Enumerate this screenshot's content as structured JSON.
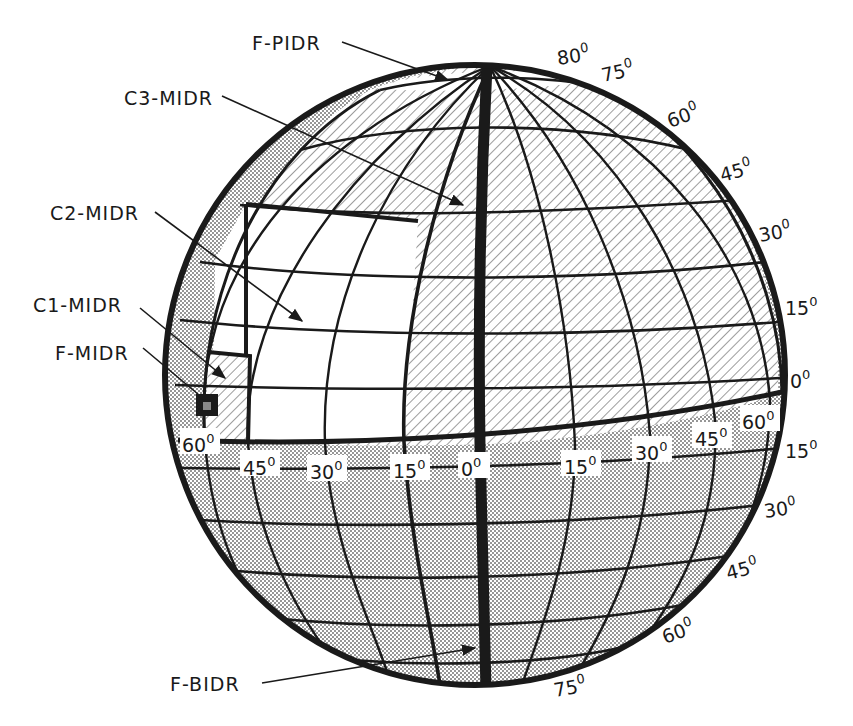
{
  "figure": {
    "type": "globe-coverage-diagram",
    "colors": {
      "background": "#ffffff",
      "ink": "#1a1a1a",
      "stipple": "#9a9a9a",
      "hatch": "#555555"
    }
  },
  "callouts": [
    {
      "id": "f-pidr",
      "label": "F-PIDR"
    },
    {
      "id": "c3-midr",
      "label": "C3-MIDR"
    },
    {
      "id": "c2-midr",
      "label": "C2-MIDR"
    },
    {
      "id": "c1-midr",
      "label": "C1-MIDR"
    },
    {
      "id": "f-midr",
      "label": "F-MIDR"
    },
    {
      "id": "f-bidr",
      "label": "F-BIDR"
    }
  ],
  "latitude_labels_north": [
    {
      "value": "80",
      "unit": "0"
    },
    {
      "value": "75",
      "unit": "0"
    },
    {
      "value": "60",
      "unit": "0"
    },
    {
      "value": "45",
      "unit": "0"
    },
    {
      "value": "30",
      "unit": "0"
    },
    {
      "value": "15",
      "unit": "0"
    },
    {
      "value": "0",
      "unit": "0"
    }
  ],
  "latitude_labels_south": [
    {
      "value": "15",
      "unit": "0"
    },
    {
      "value": "30",
      "unit": "0"
    },
    {
      "value": "45",
      "unit": "0"
    },
    {
      "value": "60",
      "unit": "0"
    },
    {
      "value": "75",
      "unit": "0"
    }
  ],
  "longitude_labels": [
    {
      "value": "60",
      "unit": "0"
    },
    {
      "value": "45",
      "unit": "0"
    },
    {
      "value": "30",
      "unit": "0"
    },
    {
      "value": "15",
      "unit": "0"
    },
    {
      "value": "0",
      "unit": "0"
    },
    {
      "value": "15",
      "unit": "0"
    },
    {
      "value": "30",
      "unit": "0"
    },
    {
      "value": "45",
      "unit": "0"
    },
    {
      "value": "60",
      "unit": "0"
    }
  ]
}
